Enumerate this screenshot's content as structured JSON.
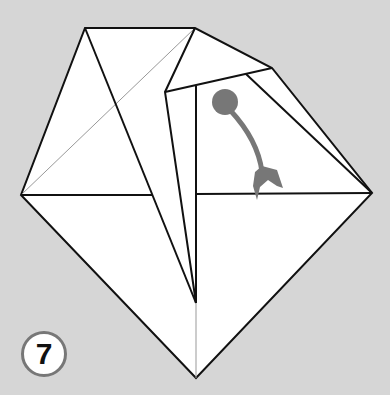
{
  "diagram": {
    "type": "origami-fold-step",
    "background_color": "#d6d6d6",
    "paper_color": "#ffffff",
    "line_color": "#111111",
    "arrow_color": "#777777",
    "step_number": "7",
    "arrow": {
      "kind": "fold-arrow",
      "start": "circle-dot",
      "direction": "down"
    }
  }
}
